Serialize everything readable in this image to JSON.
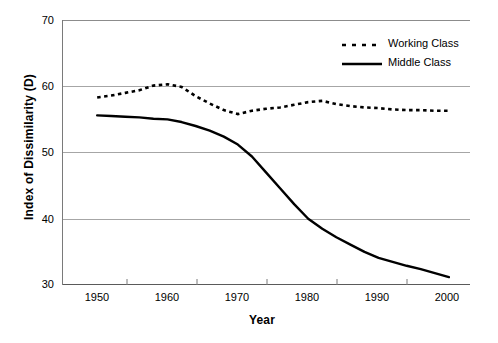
{
  "chart_data": {
    "type": "line",
    "title": "",
    "xlabel": "Year",
    "ylabel": "Index of Dissimilarity (D)",
    "xlim": [
      1945,
      2003
    ],
    "ylim": [
      30,
      70
    ],
    "yticks": [
      30,
      40,
      50,
      60,
      70
    ],
    "xticks": [
      1950,
      1960,
      1970,
      1980,
      1990,
      2000
    ],
    "grid": "horizontal",
    "legend_position": "top-right",
    "x": [
      1950,
      1952,
      1954,
      1956,
      1958,
      1960,
      1962,
      1964,
      1966,
      1968,
      1970,
      1972,
      1974,
      1976,
      1978,
      1980,
      1982,
      1984,
      1986,
      1988,
      1990,
      1992,
      1994,
      1996,
      1998,
      2000
    ],
    "series": [
      {
        "name": "Working Class",
        "style": "dotted",
        "color": "#000000",
        "values": [
          58.3,
          58.6,
          59.0,
          59.4,
          60.1,
          60.3,
          59.9,
          58.5,
          57.4,
          56.4,
          55.8,
          56.3,
          56.6,
          56.8,
          57.2,
          57.6,
          57.8,
          57.3,
          57.0,
          56.8,
          56.7,
          56.5,
          56.4,
          56.4,
          56.3,
          56.3
        ]
      },
      {
        "name": "Middle Class",
        "style": "solid",
        "color": "#000000",
        "values": [
          55.6,
          55.5,
          55.4,
          55.3,
          55.1,
          55.0,
          54.6,
          54.0,
          53.3,
          52.4,
          51.2,
          49.4,
          47.0,
          44.6,
          42.2,
          40.0,
          38.5,
          37.2,
          36.1,
          35.0,
          34.1,
          33.5,
          32.9,
          32.4,
          31.8,
          31.2
        ]
      }
    ]
  },
  "legend": {
    "items": [
      {
        "label": "Working Class",
        "style": "dotted"
      },
      {
        "label": "Middle Class",
        "style": "solid"
      }
    ]
  },
  "axis_tick_text": {
    "y": [
      "70",
      "60",
      "50",
      "40",
      "30"
    ],
    "x": [
      "1950",
      "1960",
      "1970",
      "1980",
      "1990",
      "2000"
    ]
  }
}
